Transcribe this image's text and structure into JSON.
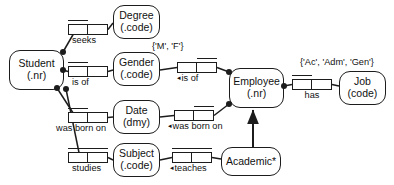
{
  "diagram": {
    "type": "orm-fact-diagram",
    "background_color": "#ffffff",
    "line_color": "#1c1c1c",
    "text_color": "#111111"
  },
  "entities": [
    {
      "id": "student",
      "name": "Student",
      "reference": "(.nr)",
      "x": 9,
      "y": 50,
      "w": 55,
      "h": 40
    },
    {
      "id": "degree",
      "name": "Degree",
      "reference": "(.code)",
      "x": 113,
      "y": 5,
      "w": 47,
      "h": 34
    },
    {
      "id": "gender",
      "name": "Gender",
      "reference": "(.code)",
      "x": 113,
      "y": 52,
      "w": 47,
      "h": 34
    },
    {
      "id": "date",
      "name": "Date",
      "reference": "(dmy)",
      "x": 113,
      "y": 100,
      "w": 47,
      "h": 34
    },
    {
      "id": "subject",
      "name": "Subject",
      "reference": "(.code)",
      "x": 113,
      "y": 143,
      "w": 47,
      "h": 34
    },
    {
      "id": "employee",
      "name": "Employee",
      "reference": "(.nr)",
      "x": 229,
      "y": 68,
      "w": 55,
      "h": 40
    },
    {
      "id": "job",
      "name": "Job",
      "reference": "(code)",
      "x": 339,
      "y": 71,
      "w": 47,
      "h": 34
    },
    {
      "id": "academic",
      "name": "Academic*",
      "reference": "",
      "x": 221,
      "y": 147,
      "w": 60,
      "h": 29
    }
  ],
  "predicates": [
    {
      "id": "seeks",
      "label": "seeks",
      "arrow": "",
      "x": 68,
      "y": 24,
      "w": 40,
      "cells": [
        20,
        20
      ],
      "uniqueness": {
        "left": 0,
        "width": 20
      },
      "label_align": "left",
      "label_offset": 4
    },
    {
      "id": "is-of-gender",
      "label": "is of",
      "arrow": "",
      "x": 68,
      "y": 66,
      "w": 40,
      "cells": [
        20,
        20
      ],
      "uniqueness": {
        "left": 0,
        "width": 20
      },
      "label_align": "left",
      "label_offset": 4
    },
    {
      "id": "is-of-employee",
      "label": "is of",
      "arrow": "◂",
      "x": 177,
      "y": 62,
      "w": 40,
      "cells": [
        20,
        20
      ],
      "uniqueness": {
        "left": 20,
        "width": 20
      },
      "label_align": "left",
      "label_offset": 0
    },
    {
      "id": "was-born-on-student",
      "label": "was born on",
      "arrow": "",
      "x": 68,
      "y": 112,
      "w": 40,
      "cells": [
        20,
        20
      ],
      "uniqueness": {
        "left": 0,
        "width": 20
      },
      "label_align": "left",
      "label_offset": -12
    },
    {
      "id": "was-born-on-employee",
      "label": "was born on",
      "arrow": "◂",
      "x": 174,
      "y": 110,
      "w": 40,
      "cells": [
        20,
        20
      ],
      "uniqueness": {
        "left": 20,
        "width": 20
      },
      "label_align": "left",
      "label_offset": -6
    },
    {
      "id": "has-job",
      "label": "has",
      "arrow": "",
      "x": 292,
      "y": 79,
      "w": 40,
      "cells": [
        20,
        20
      ],
      "uniqueness": {
        "left": 0,
        "width": 20
      },
      "label_align": "center",
      "label_offset": 0
    },
    {
      "id": "studies",
      "label": "studies",
      "arrow": "",
      "x": 68,
      "y": 152,
      "w": 40,
      "cells": [
        20,
        20
      ],
      "uniqueness": {
        "left": 0,
        "width": 40
      },
      "label_align": "left",
      "label_offset": 4
    },
    {
      "id": "teaches",
      "label": "teaches",
      "arrow": "◂",
      "x": 172,
      "y": 152,
      "w": 40,
      "cells": [
        20,
        20
      ],
      "uniqueness": {
        "left": 0,
        "width": 40
      },
      "label_align": "left",
      "label_offset": -2
    }
  ],
  "value_constraints": [
    {
      "id": "gender-values",
      "text": "{'M', 'F'}",
      "x": 152,
      "y": 42
    },
    {
      "id": "job-values",
      "text": "{'Ac', 'Adm', 'Gen'}",
      "x": 300,
      "y": 58
    }
  ],
  "mandatory_dots": [
    {
      "id": "student-seeks-dot",
      "cx": 63,
      "cy": 52
    },
    {
      "id": "student-gender-dot",
      "cx": 63,
      "cy": 70
    },
    {
      "id": "student-date-dot",
      "cx": 57,
      "cy": 88
    },
    {
      "id": "student-subject-dot",
      "cx": 66,
      "cy": 89
    },
    {
      "id": "employee-gender-dot",
      "cx": 229,
      "cy": 72
    },
    {
      "id": "employee-date-dot",
      "cx": 229,
      "cy": 104
    },
    {
      "id": "employee-job-dot",
      "cx": 284,
      "cy": 86
    }
  ],
  "subtype_link": {
    "id": "academic-is-employee",
    "from": "academic",
    "to": "employee",
    "style": "solid-arrow"
  }
}
